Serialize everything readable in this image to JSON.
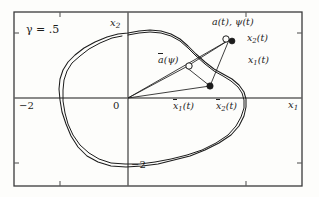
{
  "figure": {
    "kind": "phase-plane-diagram",
    "background_color": "#fdfdfb",
    "ink_color": "#1c1c1c",
    "frame": {
      "x": 14,
      "y": 12,
      "width": 288,
      "height": 174
    }
  },
  "annotations": {
    "parameter": {
      "symbol": "γ",
      "equals": "=",
      "value": ".5",
      "text": "γ = .5"
    }
  },
  "axes": {
    "origin_px": {
      "x": 128,
      "y": 98
    },
    "x_axis": {
      "label": "x",
      "label_sub": "1",
      "y_px": 98,
      "ticks": [
        {
          "label": "−2",
          "value": -2,
          "x_px": 60
        },
        {
          "label": "0",
          "value": 0,
          "x_px": 128
        }
      ]
    },
    "y_axis": {
      "label": "x",
      "label_sub": "2",
      "x_px": 128,
      "ticks": [
        {
          "label": "−2",
          "value": -2,
          "y_px": 163
        }
      ]
    }
  },
  "chart_data": {
    "type": "line",
    "title": "",
    "xlabel": "x1",
    "ylabel": "x2",
    "grid": false,
    "legend": null,
    "xlim": [
      -2.9,
      2.55
    ],
    "ylim": [
      -2.55,
      2.55
    ],
    "series": [
      {
        "name": "limit-cycle-orbit-outer",
        "closed": true,
        "points_px": [
          [
            128,
            33
          ],
          [
            139,
            31
          ],
          [
            150,
            30
          ],
          [
            161,
            31
          ],
          [
            171,
            34
          ],
          [
            180,
            39
          ],
          [
            188,
            46
          ],
          [
            196,
            54
          ],
          [
            205,
            62
          ],
          [
            214,
            69
          ],
          [
            223,
            74
          ],
          [
            232,
            79
          ],
          [
            239,
            85
          ],
          [
            244,
            92
          ],
          [
            246,
            99
          ],
          [
            246,
            107
          ],
          [
            244,
            116
          ],
          [
            239,
            126
          ],
          [
            231,
            135
          ],
          [
            219,
            143
          ],
          [
            205,
            150
          ],
          [
            190,
            156
          ],
          [
            174,
            160
          ],
          [
            158,
            164
          ],
          [
            142,
            166
          ],
          [
            126,
            167
          ],
          [
            111,
            166
          ],
          [
            98,
            162
          ],
          [
            87,
            156
          ],
          [
            78,
            147
          ],
          [
            71,
            136
          ],
          [
            66,
            124
          ],
          [
            62,
            112
          ],
          [
            60,
            100
          ],
          [
            59,
            89
          ],
          [
            60,
            79
          ],
          [
            63,
            70
          ],
          [
            68,
            62
          ],
          [
            75,
            55
          ],
          [
            84,
            48
          ],
          [
            95,
            42
          ],
          [
            107,
            37
          ],
          [
            118,
            34
          ],
          [
            128,
            33
          ]
        ]
      },
      {
        "name": "limit-cycle-orbit-inner",
        "closed": false,
        "points_px": [
          [
            128,
            35
          ],
          [
            139,
            33
          ],
          [
            150,
            32
          ],
          [
            161,
            33
          ],
          [
            171,
            36
          ],
          [
            180,
            41
          ],
          [
            188,
            48
          ],
          [
            196,
            56
          ],
          [
            205,
            64
          ],
          [
            214,
            71
          ],
          [
            223,
            76
          ],
          [
            231,
            81
          ],
          [
            238,
            87
          ],
          [
            242,
            93
          ],
          [
            244,
            100
          ],
          [
            244,
            108
          ],
          [
            241,
            117
          ],
          [
            236,
            126
          ],
          [
            228,
            135
          ],
          [
            216,
            143
          ],
          [
            202,
            150
          ],
          [
            187,
            155
          ],
          [
            171,
            159
          ],
          [
            155,
            162
          ],
          [
            140,
            164
          ],
          [
            125,
            164
          ],
          [
            111,
            163
          ],
          [
            99,
            159
          ],
          [
            89,
            153
          ],
          [
            80,
            145
          ],
          [
            73,
            135
          ],
          [
            68,
            124
          ],
          [
            65,
            113
          ],
          [
            63,
            101
          ],
          [
            63,
            90
          ],
          [
            64,
            80
          ],
          [
            67,
            71
          ],
          [
            72,
            63
          ],
          [
            80,
            56
          ],
          [
            89,
            49
          ],
          [
            100,
            43
          ],
          [
            112,
            38
          ],
          [
            122,
            36
          ]
        ]
      }
    ],
    "vectors": [
      {
        "name": "origin-to-a",
        "from_px": [
          128,
          98
        ],
        "to_px": [
          229,
          40
        ]
      },
      {
        "name": "origin-to-abar",
        "from_px": [
          128,
          98
        ],
        "to_px": [
          186,
          67
        ]
      },
      {
        "name": "origin-to-xbar",
        "from_px": [
          128,
          98
        ],
        "to_px": [
          210,
          86
        ]
      },
      {
        "name": "abar-to-xbar",
        "from_px": [
          186,
          67
        ],
        "to_px": [
          210,
          86
        ]
      },
      {
        "name": "a-to-xbar",
        "from_px": [
          229,
          40
        ],
        "to_px": [
          210,
          86
        ]
      },
      {
        "name": "abar-to-a",
        "from_px": [
          186,
          67
        ],
        "to_px": [
          229,
          40
        ]
      }
    ],
    "markers": [
      {
        "name": "a-t-psi-t",
        "style": "open-circle",
        "x_px": 226,
        "y_px": 39,
        "r": 3.2
      },
      {
        "name": "x-t",
        "style": "filled-dot",
        "x_px": 232,
        "y_px": 41,
        "r": 3.0
      },
      {
        "name": "abar-psi",
        "style": "open-circle",
        "x_px": 189,
        "y_px": 66,
        "r": 3.2
      },
      {
        "name": "xbar-t",
        "style": "filled-dot",
        "x_px": 210,
        "y_px": 86,
        "r": 3.2
      }
    ]
  },
  "labels": {
    "a_psi_of_t": {
      "text": "a(t), ψ(t)"
    },
    "x2_of_t": {
      "base": "x",
      "sub": "2",
      "suffix": "(t)"
    },
    "x1_of_t": {
      "base": "x",
      "sub": "1",
      "suffix": "(t)"
    },
    "abar_of_psi": {
      "base": "a",
      "suffix": "(ψ)"
    },
    "xbar1_of_t": {
      "base": "x",
      "sub": "1",
      "suffix": "(t)"
    },
    "xbar2_of_t": {
      "base": "x",
      "sub": "2",
      "suffix": "(t)"
    }
  }
}
